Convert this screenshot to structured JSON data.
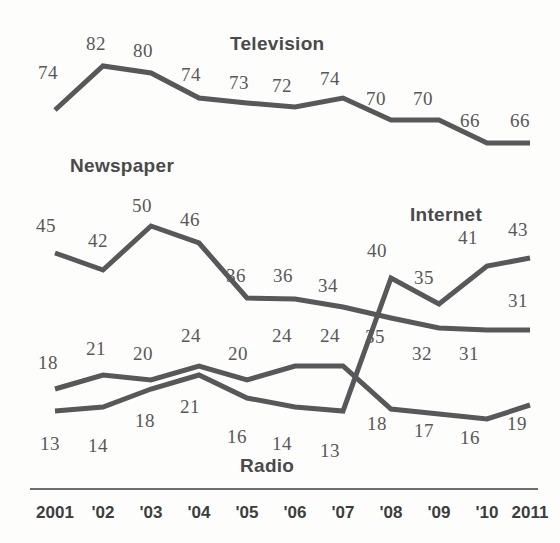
{
  "chart": {
    "type": "line",
    "title": "",
    "xlabel": "",
    "ylabel": "",
    "grid": false,
    "legend_position": "inline-series-labels"
  },
  "axis": {
    "ticks": [
      "2001",
      "'02",
      "'03",
      "'04",
      "'05",
      "'06",
      "'07",
      "'08",
      "'09",
      "'10",
      "2011"
    ]
  },
  "series_labels": {
    "television": "Television",
    "newspaper": "Newspaper",
    "internet": "Internet",
    "radio": "Radio"
  },
  "colors": {
    "line": "#58585a",
    "text": "#58585a",
    "background": "#fdfdfb"
  },
  "chart_data": {
    "type": "line",
    "title": "",
    "xlabel": "",
    "ylabel": "",
    "x": [
      "2001",
      "'02",
      "'03",
      "'04",
      "'05",
      "'06",
      "'07",
      "'08",
      "'09",
      "'10",
      "2011"
    ],
    "ylim": [
      0,
      90
    ],
    "grid": false,
    "legend_position": "inline",
    "series": [
      {
        "name": "Television",
        "values": [
          74,
          82,
          80,
          74,
          73,
          72,
          74,
          70,
          70,
          66,
          66
        ],
        "labels": [
          "74",
          "82",
          "80",
          "74",
          "73",
          "72",
          "74",
          "70",
          "70",
          "66",
          "66"
        ]
      },
      {
        "name": "Newspaper",
        "values": [
          45,
          42,
          50,
          46,
          36,
          36,
          34,
          35,
          32,
          31,
          31
        ],
        "labels": [
          "45",
          "42",
          "50",
          "46",
          "36",
          "36",
          "34",
          "35",
          "32",
          "31",
          "31"
        ]
      },
      {
        "name": "Radio",
        "values": [
          18,
          21,
          20,
          24,
          20,
          24,
          24,
          18,
          17,
          16,
          19
        ],
        "labels": [
          "18",
          "21",
          "20",
          "24",
          "20",
          "24",
          "24",
          "18",
          "17",
          "16",
          "19"
        ]
      },
      {
        "name": "Internet",
        "values": [
          13,
          14,
          18,
          21,
          16,
          14,
          13,
          40,
          35,
          41,
          43
        ],
        "labels": [
          "13",
          "14",
          "18",
          "21",
          "16",
          "14",
          "13",
          "40",
          "35",
          "41",
          "43"
        ]
      }
    ]
  },
  "point_labels": {
    "television": [
      {
        "text": "74",
        "x": 38,
        "y": 62
      },
      {
        "text": "82",
        "x": 86,
        "y": 33
      },
      {
        "text": "80",
        "x": 133,
        "y": 40
      },
      {
        "text": "74",
        "x": 181,
        "y": 64
      },
      {
        "text": "73",
        "x": 229,
        "y": 72
      },
      {
        "text": "72",
        "x": 272,
        "y": 75
      },
      {
        "text": "74",
        "x": 320,
        "y": 68
      },
      {
        "text": "70",
        "x": 366,
        "y": 88
      },
      {
        "text": "70",
        "x": 413,
        "y": 88
      },
      {
        "text": "66",
        "x": 460,
        "y": 110
      },
      {
        "text": "66",
        "x": 510,
        "y": 110
      }
    ],
    "newspaper": [
      {
        "text": "45",
        "x": 36,
        "y": 215
      },
      {
        "text": "42",
        "x": 88,
        "y": 230
      },
      {
        "text": "50",
        "x": 132,
        "y": 195
      },
      {
        "text": "46",
        "x": 180,
        "y": 209
      },
      {
        "text": "36",
        "x": 226,
        "y": 265
      },
      {
        "text": "36",
        "x": 273,
        "y": 265
      },
      {
        "text": "34",
        "x": 318,
        "y": 275
      },
      {
        "text": "35",
        "x": 365,
        "y": 326
      },
      {
        "text": "32",
        "x": 412,
        "y": 343
      },
      {
        "text": "31",
        "x": 459,
        "y": 343
      },
      {
        "text": "31",
        "x": 508,
        "y": 290
      }
    ],
    "radio": [
      {
        "text": "18",
        "x": 38,
        "y": 352
      },
      {
        "text": "21",
        "x": 86,
        "y": 338
      },
      {
        "text": "20",
        "x": 133,
        "y": 343
      },
      {
        "text": "24",
        "x": 181,
        "y": 325
      },
      {
        "text": "20",
        "x": 228,
        "y": 343
      },
      {
        "text": "24",
        "x": 272,
        "y": 325
      },
      {
        "text": "24",
        "x": 320,
        "y": 325
      },
      {
        "text": "18",
        "x": 367,
        "y": 413
      },
      {
        "text": "17",
        "x": 414,
        "y": 420
      },
      {
        "text": "16",
        "x": 460,
        "y": 427
      },
      {
        "text": "19",
        "x": 507,
        "y": 413
      }
    ],
    "internet": [
      {
        "text": "13",
        "x": 40,
        "y": 433
      },
      {
        "text": "14",
        "x": 88,
        "y": 435
      },
      {
        "text": "18",
        "x": 135,
        "y": 410
      },
      {
        "text": "21",
        "x": 180,
        "y": 396
      },
      {
        "text": "16",
        "x": 227,
        "y": 426
      },
      {
        "text": "14",
        "x": 272,
        "y": 433
      },
      {
        "text": "13",
        "x": 320,
        "y": 440
      },
      {
        "text": "40",
        "x": 367,
        "y": 240
      },
      {
        "text": "35",
        "x": 414,
        "y": 267
      },
      {
        "text": "41",
        "x": 458,
        "y": 227
      },
      {
        "text": "43",
        "x": 508,
        "y": 219
      }
    ]
  },
  "series_label_positions": {
    "television": {
      "x": 230,
      "y": 33
    },
    "newspaper": {
      "x": 70,
      "y": 155
    },
    "internet": {
      "x": 410,
      "y": 204
    },
    "radio": {
      "x": 240,
      "y": 455
    }
  },
  "tick_positions": [
    55,
    103,
    151,
    199,
    247,
    295,
    343,
    391,
    439,
    487,
    530
  ]
}
